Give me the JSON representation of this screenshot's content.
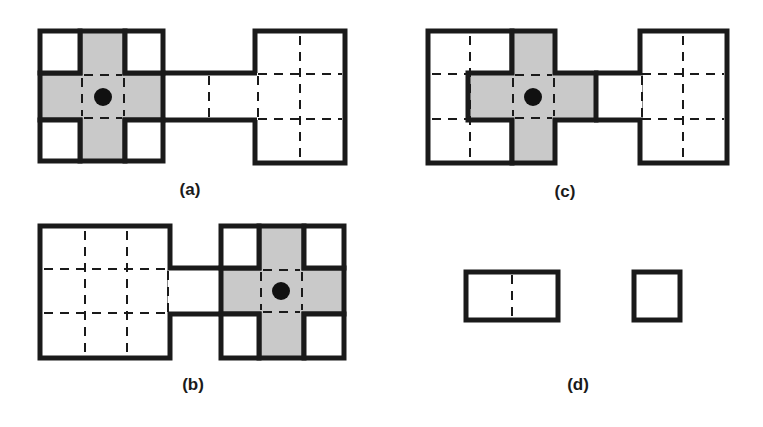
{
  "figure": {
    "background_color": "#ffffff",
    "stroke_color": "#1a1a1a",
    "fill_gray": "#c9c9c9",
    "fill_white": "#ffffff",
    "dot_color": "#111111",
    "stroke_width": 5,
    "dash_pattern": "9 7",
    "dash_width": 2
  },
  "panels": [
    {
      "id": "a",
      "label": "(a)",
      "label_x": 190,
      "label_y": 195,
      "description": "Gray cross inside square on the left, white corner squares, wide white rectangle on the right joined by a corridor",
      "cross_center": {
        "x": 103,
        "y": 97
      },
      "dot_radius": 9,
      "left_block": {
        "x": 40,
        "y": 31,
        "w": 123,
        "h": 130
      },
      "right_block": {
        "x": 255,
        "y": 31,
        "w": 90,
        "h": 132
      },
      "corridor": {
        "x1": 163,
        "x2": 255,
        "y1": 73,
        "y2": 120
      }
    },
    {
      "id": "b",
      "label": "(b)",
      "label_x": 193,
      "label_y": 390,
      "description": "Mirror of panel (a): wide white rectangle on the left joined by a corridor to a gray cross inside a square on the right",
      "cross_center": {
        "x": 281,
        "y": 291
      },
      "dot_radius": 9,
      "left_block": {
        "x": 40,
        "y": 226,
        "w": 130,
        "h": 132
      },
      "right_block": {
        "x": 221,
        "y": 226,
        "w": 123,
        "h": 132
      },
      "corridor": {
        "x1": 170,
        "x2": 221,
        "y1": 268,
        "y2": 314
      }
    },
    {
      "id": "c",
      "label": "(c)",
      "label_x": 565,
      "label_y": 197,
      "description": "Tall white square on the left overlapped by a gray cross shifted right, joined by a short corridor to a tall white rectangle on the right",
      "cross_center": {
        "x": 533,
        "y": 97
      },
      "dot_radius": 9,
      "left_block": {
        "x": 428,
        "y": 31,
        "w": 84,
        "h": 132
      },
      "right_block": {
        "x": 640,
        "y": 31,
        "w": 87,
        "h": 132
      },
      "corridor": {
        "x1": 596,
        "x2": 640,
        "y1": 73,
        "y2": 120
      }
    },
    {
      "id": "d",
      "label": "(d)",
      "label_x": 578,
      "label_y": 390,
      "description": "Two plain white outlined shapes: a wide rectangle split by a central dashed line, and a small square",
      "wide_rect": {
        "x": 466,
        "y": 272,
        "w": 92,
        "h": 48
      },
      "small_square": {
        "x": 634,
        "y": 272,
        "w": 46,
        "h": 48
      }
    }
  ],
  "legend_notes": {
    "gray_region_meaning": "shaded cross-shaped region",
    "dot_meaning": "center point marker",
    "dashed_meaning": "internal grid / cell subdivision lines"
  }
}
